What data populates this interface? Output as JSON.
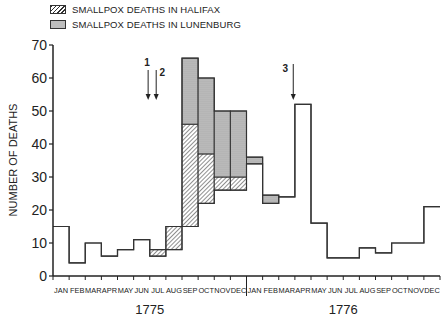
{
  "legend": {
    "halifax": "SMALLPOX DEATHS IN HALIFAX",
    "lunenburg": "SMALLPOX DEATHS IN LUNENBURG"
  },
  "chart_data": {
    "type": "bar",
    "subtype": "stacked step histogram",
    "title": "",
    "xlabel": "",
    "ylabel": "NUMBER OF DEATHS",
    "ylim": [
      0,
      70
    ],
    "yticks": [
      0,
      10,
      20,
      30,
      40,
      50,
      60,
      70
    ],
    "years": [
      "1775",
      "1776"
    ],
    "categories": [
      "JAN",
      "FEB",
      "MAR",
      "APR",
      "MAY",
      "JUN",
      "JUL",
      "AUG",
      "SEP",
      "OCT",
      "NOV",
      "DEC",
      "JAN",
      "FEB",
      "MAR",
      "APR",
      "MAY",
      "JUN",
      "JUL",
      "AUG",
      "SEP",
      "OCT",
      "NOV",
      "DEC"
    ],
    "series": [
      {
        "name": "Other deaths (base)",
        "values": [
          15,
          4,
          10,
          6,
          8,
          11,
          6,
          8,
          15,
          22,
          26,
          26,
          34,
          22,
          24,
          52,
          16,
          5.5,
          5.5,
          8.5,
          7,
          10,
          10,
          21
        ]
      },
      {
        "name": "SMALLPOX DEATHS IN HALIFAX",
        "values": [
          0,
          0,
          0,
          0,
          0,
          0,
          2,
          7,
          31,
          15,
          4,
          4,
          0,
          0,
          0,
          0,
          0,
          0,
          0,
          0,
          0,
          0,
          0,
          0
        ]
      },
      {
        "name": "SMALLPOX DEATHS IN LUNENBURG",
        "values": [
          0,
          0,
          0,
          0,
          0,
          0,
          0,
          0,
          20,
          23,
          20,
          20,
          2,
          2.5,
          0,
          0,
          0,
          0,
          0,
          0,
          0,
          0,
          0,
          0
        ]
      }
    ],
    "totals": [
      15,
      4,
      10,
      6,
      8,
      11,
      8,
      15,
      66,
      60,
      50,
      50,
      36,
      24.5,
      24,
      52,
      16,
      5.5,
      5.5,
      8.5,
      7,
      10,
      10,
      21
    ],
    "annotations": [
      {
        "label": "1",
        "month_index": 5.9,
        "type": "arrow"
      },
      {
        "label": "2",
        "month_index": 6.4,
        "type": "arrow"
      },
      {
        "label": "3",
        "month_index": 14.9,
        "type": "arrow"
      }
    ],
    "grid": false,
    "legend_position": "top-left"
  }
}
